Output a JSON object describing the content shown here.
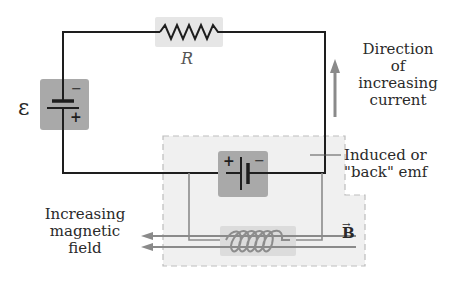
{
  "figure": {
    "type": "circuit-diagram",
    "labels": {
      "emf_symbol": "ε",
      "resistor": "R",
      "battery_plus": "+",
      "battery_minus": "−",
      "inner_battery_plus": "+",
      "inner_battery_minus": "−",
      "direction_line1": "Direction",
      "direction_line2": "of",
      "direction_line3": "increasing",
      "direction_line4": "current",
      "induced_line1": "Induced or",
      "induced_line2": "\"back\" emf",
      "field_line1": "Increasing",
      "field_line2": "magnetic",
      "field_line3": "field",
      "b_vector": "B",
      "b_arrow": "→"
    },
    "colors": {
      "wire": "#1e1e1e",
      "gray_wire": "#8c8c8c",
      "component_box": "#e6e6e6",
      "battery_box": "#a9a9a9",
      "dashed_region": "#f0f0f0",
      "dashed_border": "#bdbdbd",
      "arrow": "#8a8a8a"
    }
  }
}
